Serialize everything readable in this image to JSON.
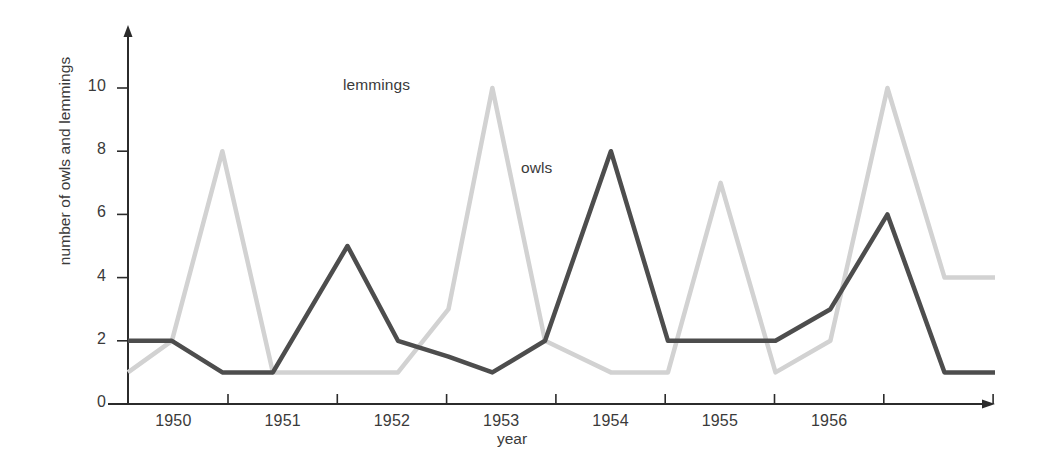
{
  "chart_data": {
    "type": "line",
    "title": "",
    "xlabel": "year",
    "ylabel": "number of owls and lemmings",
    "grid": false,
    "legend_position": "inline-annotation",
    "ylim": [
      0,
      11
    ],
    "yticks": [
      0,
      2,
      4,
      6,
      8,
      10
    ],
    "ytick_labels": [
      "0",
      "2",
      "4",
      "6",
      "8",
      "10"
    ],
    "xtick_labels": [
      "1950",
      "1951",
      "1952",
      "1953",
      "1954",
      "1955",
      "1956"
    ],
    "x": [
      0,
      0.2,
      0.43,
      0.66,
      1.0,
      1.23,
      1.46,
      1.66,
      1.9,
      2.2,
      2.46,
      2.7,
      2.95,
      3.2,
      3.46,
      3.72,
      3.95
    ],
    "series": [
      {
        "name": "owls",
        "color": "#4d4d4d",
        "values": [
          2,
          2,
          1,
          1,
          5,
          2,
          1.5,
          1,
          2,
          8,
          2,
          2,
          2,
          3,
          6,
          1,
          1
        ]
      },
      {
        "name": "lemmings",
        "color": "#d2d2d2",
        "values": [
          1,
          2,
          8,
          1,
          1,
          1,
          3,
          10,
          2,
          1,
          1,
          7,
          1,
          2,
          10,
          4,
          4
        ]
      }
    ],
    "annotations": [
      {
        "text": "lemmings",
        "x_px": 343,
        "y_px": 76
      },
      {
        "text": "owls",
        "x_px": 521,
        "y_px": 159
      }
    ],
    "axis_color": "#2b2b2b"
  }
}
